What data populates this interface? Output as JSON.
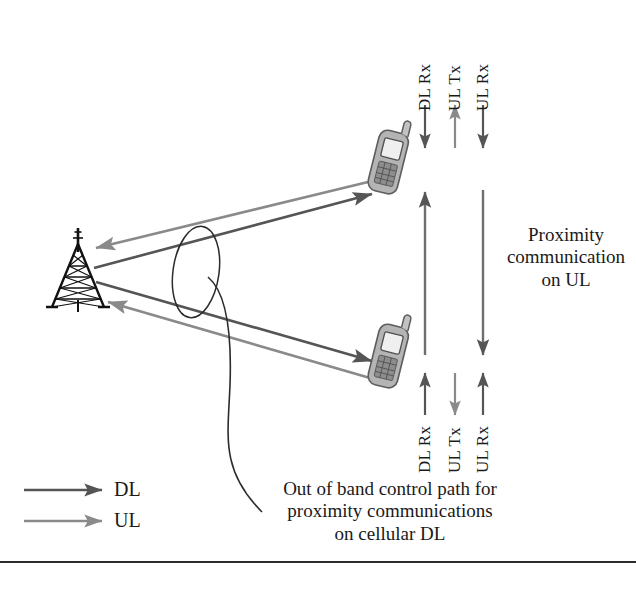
{
  "figure": {
    "type": "network-architecture-diagram",
    "background_color": "#ffffff",
    "colors": {
      "downlink": "#555555",
      "uplink": "#8a8a8a",
      "text": "#1a1a1a",
      "tower": "#111111",
      "phone_body": "#9a9a9a",
      "leader_line": "#2b2b2b"
    }
  },
  "nodes": {
    "base_station": {
      "name": "cell-tower",
      "x": 78,
      "y": 270
    },
    "phone_upper": {
      "name": "mobile-phone-upper",
      "x": 388,
      "y": 163
    },
    "phone_lower": {
      "name": "mobile-phone-lower",
      "x": 388,
      "y": 357
    }
  },
  "cellular_links": {
    "upper_dl_label": "DL",
    "upper_ul_label": "UL",
    "lower_dl_label": "DL",
    "lower_ul_label": "UL"
  },
  "upper_device_labels": [
    {
      "text": "DL Rx",
      "direction": "down",
      "color": "#555555"
    },
    {
      "text": "UL Tx",
      "direction": "up",
      "color": "#8a8a8a"
    },
    {
      "text": "UL Rx",
      "direction": "down",
      "color": "#555555"
    }
  ],
  "lower_device_labels": [
    {
      "text": "DL Rx",
      "direction": "up",
      "color": "#555555"
    },
    {
      "text": "UL Tx",
      "direction": "down",
      "color": "#8a8a8a"
    },
    {
      "text": "UL Rx",
      "direction": "up",
      "color": "#555555"
    }
  ],
  "proximity": {
    "annotation_line1": "Proximity",
    "annotation_line2": "communication",
    "annotation_line3": "on UL",
    "arrow_up_label": "proximity-uplink-up-arrow",
    "arrow_down_label": "proximity-uplink-down-arrow"
  },
  "callout": {
    "line1": "Out of band control path for",
    "line2": "proximity communications",
    "line3": "on cellular DL"
  },
  "legend": {
    "items": [
      {
        "label": "DL",
        "color": "#555555",
        "name": "legend-downlink"
      },
      {
        "label": "UL",
        "color": "#8a8a8a",
        "name": "legend-uplink"
      }
    ]
  }
}
